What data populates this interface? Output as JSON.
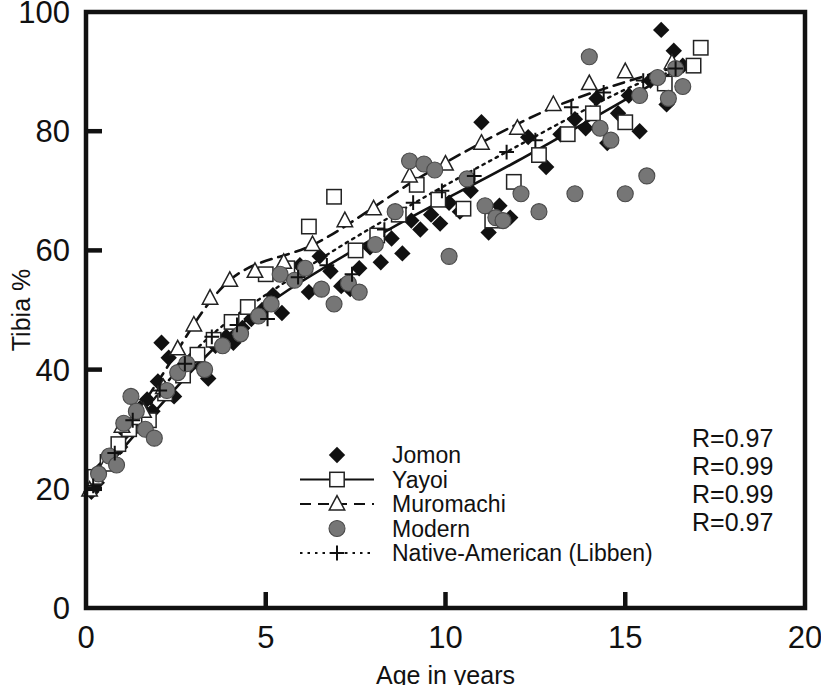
{
  "chart": {
    "type": "scatter",
    "title": "",
    "xlabel": "Age in years",
    "ylabel": "Tibia %",
    "xlim": [
      0,
      20
    ],
    "ylim": [
      0,
      100
    ],
    "xticks": [
      "0",
      "5",
      "10",
      "15",
      "20"
    ],
    "yticks": [
      "0",
      "20",
      "40",
      "60",
      "80",
      "100"
    ],
    "xtick_values": [
      0,
      5,
      10,
      15,
      20
    ],
    "ytick_values": [
      0,
      20,
      40,
      60,
      80,
      100
    ],
    "grid": false,
    "frame": true,
    "legend_position": "inside-bottom-center"
  },
  "legend": {
    "entries": [
      {
        "label": "Jomon",
        "marker": "filled-diamond",
        "line": "none",
        "color": "#111111"
      },
      {
        "label": "Yayoi",
        "marker": "open-square",
        "line": "solid",
        "color": "#111111"
      },
      {
        "label": "Muromachi",
        "marker": "open-triangle",
        "line": "dashed",
        "color": "#111111"
      },
      {
        "label": "Modern",
        "marker": "gray-circle",
        "line": "none",
        "color": "#767676"
      },
      {
        "label": "Native-American (Libben)",
        "marker": "plus",
        "line": "dotted",
        "color": "#111111"
      }
    ]
  },
  "annotations": {
    "r_values": [
      "R=0.97",
      "R=0.99",
      "R=0.99",
      "R=0.97"
    ]
  },
  "chart_data": {
    "type": "scatter",
    "title": "",
    "xlabel": "Age in years",
    "ylabel": "Tibia %",
    "xlim": [
      0,
      20
    ],
    "ylim": [
      0,
      100
    ],
    "xticks": [
      0,
      5,
      10,
      15,
      20
    ],
    "yticks": [
      0,
      20,
      40,
      60,
      80,
      100
    ],
    "grid": false,
    "legend": [
      "Jomon",
      "Yayoi",
      "Muromachi",
      "Modern",
      "Native-American (Libben)"
    ],
    "annotations": [
      "R=0.97",
      "R=0.99",
      "R=0.99",
      "R=0.97"
    ],
    "series": [
      {
        "name": "Jomon",
        "marker": "filled-diamond",
        "color": "#111111",
        "points": [
          [
            0.15,
            19.5
          ],
          [
            0.3,
            21.0
          ],
          [
            0.45,
            23.5
          ],
          [
            0.7,
            25.0
          ],
          [
            0.95,
            27.0
          ],
          [
            1.1,
            29.5
          ],
          [
            1.35,
            31.0
          ],
          [
            1.5,
            33.5
          ],
          [
            1.7,
            35.0
          ],
          [
            1.85,
            33.0
          ],
          [
            2.0,
            38.0
          ],
          [
            2.1,
            44.5
          ],
          [
            2.3,
            42.0
          ],
          [
            2.45,
            35.5
          ],
          [
            2.6,
            40.0
          ],
          [
            2.9,
            41.5
          ],
          [
            3.2,
            40.5
          ],
          [
            3.4,
            38.5
          ],
          [
            3.6,
            44.0
          ],
          [
            3.9,
            45.5
          ],
          [
            4.1,
            44.5
          ],
          [
            4.35,
            47.0
          ],
          [
            4.6,
            48.5
          ],
          [
            4.9,
            50.0
          ],
          [
            5.2,
            52.5
          ],
          [
            5.45,
            49.5
          ],
          [
            5.7,
            55.5
          ],
          [
            5.95,
            57.5
          ],
          [
            6.2,
            53.0
          ],
          [
            6.5,
            59.0
          ],
          [
            6.8,
            56.5
          ],
          [
            7.1,
            54.0
          ],
          [
            7.35,
            53.5
          ],
          [
            7.6,
            57.0
          ],
          [
            7.9,
            60.5
          ],
          [
            8.2,
            58.0
          ],
          [
            8.5,
            62.0
          ],
          [
            8.8,
            59.5
          ],
          [
            9.05,
            65.0
          ],
          [
            9.3,
            63.5
          ],
          [
            9.6,
            66.0
          ],
          [
            9.85,
            64.5
          ],
          [
            10.1,
            68.0
          ],
          [
            10.4,
            66.5
          ],
          [
            10.7,
            70.0
          ],
          [
            11.0,
            81.5
          ],
          [
            11.2,
            63.0
          ],
          [
            11.5,
            67.5
          ],
          [
            11.8,
            65.5
          ],
          [
            12.3,
            79.0
          ],
          [
            12.8,
            74.0
          ],
          [
            13.2,
            79.5
          ],
          [
            13.6,
            82.0
          ],
          [
            13.9,
            80.5
          ],
          [
            14.2,
            85.5
          ],
          [
            14.5,
            78.0
          ],
          [
            14.8,
            83.0
          ],
          [
            15.1,
            86.0
          ],
          [
            15.4,
            80.0
          ],
          [
            15.7,
            88.5
          ],
          [
            16.0,
            97.0
          ],
          [
            16.15,
            84.5
          ],
          [
            16.35,
            93.5
          ],
          [
            16.6,
            91.0
          ]
        ]
      },
      {
        "name": "Yayoi",
        "marker": "open-square",
        "color": "#111111",
        "line": "solid",
        "points": [
          [
            0.25,
            22.0
          ],
          [
            0.6,
            24.5
          ],
          [
            0.9,
            27.5
          ],
          [
            1.2,
            30.0
          ],
          [
            1.45,
            32.0
          ],
          [
            1.75,
            31.5
          ],
          [
            2.2,
            36.0
          ],
          [
            2.7,
            39.0
          ],
          [
            3.1,
            42.5
          ],
          [
            3.55,
            45.0
          ],
          [
            4.05,
            48.0
          ],
          [
            4.5,
            50.5
          ],
          [
            5.0,
            56.0
          ],
          [
            5.6,
            57.0
          ],
          [
            6.2,
            64.0
          ],
          [
            6.9,
            69.0
          ],
          [
            7.5,
            60.0
          ],
          [
            8.1,
            62.5
          ],
          [
            8.7,
            66.0
          ],
          [
            9.2,
            71.0
          ],
          [
            9.8,
            68.5
          ],
          [
            10.5,
            67.0
          ],
          [
            11.3,
            65.0
          ],
          [
            11.9,
            71.5
          ],
          [
            12.6,
            76.0
          ],
          [
            13.4,
            79.5
          ],
          [
            14.1,
            83.0
          ],
          [
            15.0,
            81.5
          ],
          [
            16.1,
            88.0
          ],
          [
            16.9,
            91.0
          ],
          [
            17.1,
            94.0
          ]
        ],
        "fit_line": [
          [
            0.2,
            21.0
          ],
          [
            4.0,
            46.0
          ],
          [
            8.0,
            62.0
          ],
          [
            12.0,
            75.0
          ],
          [
            16.5,
            90.5
          ]
        ]
      },
      {
        "name": "Muromachi",
        "marker": "open-triangle",
        "color": "#111111",
        "line": "dashed",
        "points": [
          [
            0.1,
            19.8
          ],
          [
            0.55,
            24.0
          ],
          [
            1.0,
            30.5
          ],
          [
            1.6,
            33.0
          ],
          [
            2.15,
            37.0
          ],
          [
            2.55,
            43.5
          ],
          [
            3.0,
            47.5
          ],
          [
            3.45,
            52.0
          ],
          [
            4.0,
            55.0
          ],
          [
            4.7,
            56.5
          ],
          [
            5.5,
            58.0
          ],
          [
            6.3,
            61.0
          ],
          [
            7.2,
            65.0
          ],
          [
            8.0,
            67.0
          ],
          [
            9.0,
            72.5
          ],
          [
            10.0,
            74.5
          ],
          [
            11.0,
            78.0
          ],
          [
            12.0,
            80.5
          ],
          [
            13.0,
            84.5
          ],
          [
            14.0,
            88.0
          ],
          [
            15.0,
            90.0
          ],
          [
            16.3,
            91.5
          ]
        ],
        "fit_line": [
          [
            0.1,
            20.0
          ],
          [
            2.0,
            38.0
          ],
          [
            4.0,
            55.0
          ],
          [
            6.5,
            61.5
          ],
          [
            9.5,
            73.0
          ],
          [
            13.0,
            84.0
          ],
          [
            16.5,
            91.0
          ]
        ]
      },
      {
        "name": "Modern",
        "marker": "gray-circle",
        "color": "#767676",
        "points": [
          [
            0.35,
            22.5
          ],
          [
            0.65,
            25.5
          ],
          [
            0.85,
            24.0
          ],
          [
            1.05,
            31.0
          ],
          [
            1.25,
            35.5
          ],
          [
            1.4,
            33.0
          ],
          [
            1.65,
            30.0
          ],
          [
            1.9,
            28.5
          ],
          [
            2.25,
            36.5
          ],
          [
            2.55,
            39.5
          ],
          [
            2.8,
            41.0
          ],
          [
            3.3,
            40.0
          ],
          [
            3.8,
            44.0
          ],
          [
            4.3,
            46.0
          ],
          [
            4.8,
            49.0
          ],
          [
            5.15,
            51.0
          ],
          [
            5.4,
            56.0
          ],
          [
            5.8,
            55.0
          ],
          [
            6.1,
            57.0
          ],
          [
            6.55,
            53.5
          ],
          [
            6.9,
            51.0
          ],
          [
            7.3,
            54.5
          ],
          [
            7.6,
            53.0
          ],
          [
            8.05,
            61.0
          ],
          [
            8.6,
            66.5
          ],
          [
            9.0,
            75.0
          ],
          [
            9.4,
            74.5
          ],
          [
            9.7,
            73.5
          ],
          [
            10.1,
            59.0
          ],
          [
            10.6,
            72.0
          ],
          [
            11.1,
            67.5
          ],
          [
            11.4,
            65.5
          ],
          [
            11.6,
            65.0
          ],
          [
            12.1,
            69.5
          ],
          [
            12.6,
            66.5
          ],
          [
            13.6,
            69.5
          ],
          [
            14.0,
            92.5
          ],
          [
            14.3,
            80.5
          ],
          [
            14.6,
            78.5
          ],
          [
            15.0,
            69.5
          ],
          [
            15.4,
            86.0
          ],
          [
            15.6,
            72.5
          ],
          [
            15.9,
            89.0
          ],
          [
            16.2,
            85.5
          ],
          [
            16.4,
            90.5
          ],
          [
            16.6,
            87.5
          ]
        ]
      },
      {
        "name": "Native-American (Libben)",
        "marker": "plus",
        "color": "#111111",
        "line": "dotted",
        "points": [
          [
            0.2,
            20.5
          ],
          [
            0.8,
            26.0
          ],
          [
            1.3,
            31.5
          ],
          [
            2.05,
            36.5
          ],
          [
            2.75,
            41.0
          ],
          [
            3.5,
            45.5
          ],
          [
            4.2,
            47.5
          ],
          [
            5.05,
            48.5
          ],
          [
            5.9,
            55.5
          ],
          [
            6.7,
            57.5
          ],
          [
            7.4,
            56.0
          ],
          [
            8.3,
            63.5
          ],
          [
            9.1,
            68.0
          ],
          [
            9.9,
            70.0
          ],
          [
            10.8,
            72.5
          ],
          [
            11.7,
            76.5
          ],
          [
            12.5,
            78.5
          ],
          [
            13.5,
            84.0
          ],
          [
            14.4,
            86.5
          ],
          [
            15.5,
            88.5
          ],
          [
            16.4,
            90.5
          ]
        ],
        "fit_line": [
          [
            0.2,
            21.0
          ],
          [
            3.0,
            43.0
          ],
          [
            6.0,
            56.5
          ],
          [
            9.0,
            67.5
          ],
          [
            12.0,
            77.5
          ],
          [
            15.0,
            87.0
          ],
          [
            16.8,
            91.0
          ]
        ]
      }
    ]
  }
}
